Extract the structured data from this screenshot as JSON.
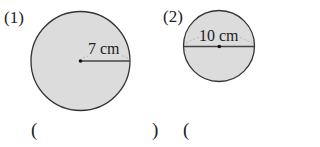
{
  "problems": [
    {
      "number": "(1)",
      "measurement_label": "7 cm",
      "measurement_type": "radius",
      "answer_open": "(",
      "answer_close": ")"
    },
    {
      "number": "(2)",
      "measurement_label": "10 cm",
      "measurement_type": "diameter",
      "answer_open": "("
    }
  ],
  "colors": {
    "circle_fill": "#dcdcdc",
    "circle_stroke": "#333333"
  }
}
